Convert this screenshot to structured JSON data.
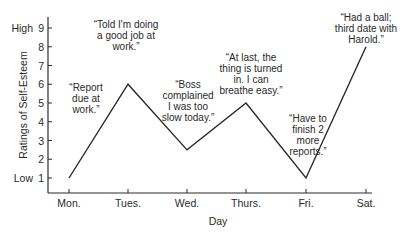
{
  "chart_data": {
    "type": "line",
    "title": "",
    "xlabel": "Day",
    "ylabel": "Ratings of Self-Esteem",
    "categories": [
      "Mon.",
      "Tues.",
      "Wed.",
      "Thurs.",
      "Fri.",
      "Sat."
    ],
    "series": [
      {
        "name": "Self-esteem",
        "values": [
          1,
          6,
          2.5,
          5,
          1,
          8
        ]
      }
    ],
    "ylim": [
      0,
      9.5
    ],
    "yticks": [
      1,
      2,
      3,
      4,
      5,
      6,
      7,
      8,
      9
    ],
    "ytick_extra_labels": {
      "1": "Low",
      "9": "High"
    },
    "grid": false,
    "legend": null,
    "annotations": [
      {
        "day": "Mon.",
        "lines": [
          "“Report",
          "due at",
          "work.”"
        ]
      },
      {
        "day": "Tues.",
        "lines": [
          "“Told I'm doing",
          "a good job at",
          "work.”"
        ]
      },
      {
        "day": "Wed.",
        "lines": [
          "“Boss",
          "complained",
          "I was too",
          "slow today.”"
        ]
      },
      {
        "day": "Thurs.",
        "lines": [
          "“At last, the",
          "thing is turned",
          "in. I can",
          "breathe easy.”"
        ]
      },
      {
        "day": "Fri.",
        "lines": [
          "“Have to",
          "finish 2",
          "more",
          "reports.”"
        ]
      },
      {
        "day": "Sat.",
        "lines": [
          "“Had a ball;",
          "third date with",
          "Harold.”"
        ]
      }
    ],
    "line_color": "#2a2a2a"
  }
}
